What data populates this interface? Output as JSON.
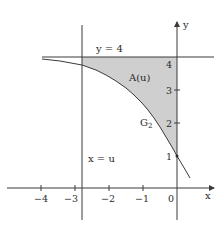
{
  "diagram": {
    "labels": {
      "y_axis": "y",
      "x_axis": "x",
      "horizontal_line": "y = 4",
      "vertical_line": "x = u",
      "area": "A(u)",
      "curve": "G",
      "curve_sub": "2"
    },
    "x_ticks": [
      "−4",
      "−3",
      "−2",
      "−1",
      "0"
    ],
    "y_ticks": [
      "1",
      "2",
      "3",
      "4"
    ],
    "colors": {
      "axis": "#3a3a3a",
      "shade": "#cfcfcf",
      "curve": "#3a3a3a"
    }
  }
}
